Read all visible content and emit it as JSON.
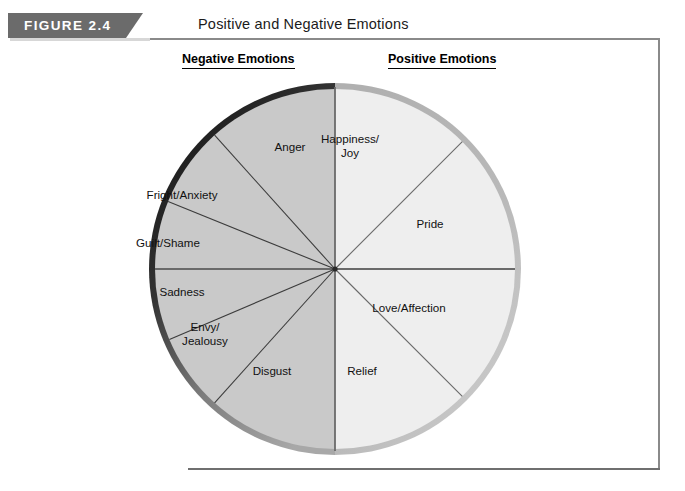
{
  "figure": {
    "number_label": "FIGURE 2.4",
    "title": "Positive and Negative Emotions"
  },
  "columns": {
    "negative_heading": "Negative Emotions",
    "positive_heading": "Positive Emotions"
  },
  "chart_data": {
    "type": "pie",
    "title": "Positive and Negative Emotions",
    "legend_position": "none",
    "grid": false,
    "groups": [
      {
        "name": "Negative Emotions",
        "fill": "#c9c9c9",
        "rim": "#2b2b2b",
        "half": "left",
        "slices": [
          {
            "label": "Anger",
            "start_deg": 90,
            "end_deg": 132
          },
          {
            "label": "Fright/Anxiety",
            "start_deg": 132,
            "end_deg": 158
          },
          {
            "label": "Guilt/Shame",
            "start_deg": 158,
            "end_deg": 180
          },
          {
            "label": "Sadness",
            "start_deg": 180,
            "end_deg": 203
          },
          {
            "label": "Envy/\nJealousy",
            "start_deg": 203,
            "end_deg": 228
          },
          {
            "label": "Disgust",
            "start_deg": 228,
            "end_deg": 270
          }
        ]
      },
      {
        "name": "Positive Emotions",
        "fill": "#ededed",
        "rim": "#b4b4b4",
        "half": "right",
        "slices": [
          {
            "label": "Happiness/\nJoy",
            "start_deg": 45,
            "end_deg": 90
          },
          {
            "label": "Pride",
            "start_deg": 0,
            "end_deg": 45
          },
          {
            "label": "Love/Affection",
            "start_deg": 315,
            "end_deg": 360
          },
          {
            "label": "Relief",
            "start_deg": 270,
            "end_deg": 315
          }
        ]
      }
    ],
    "labels": [
      {
        "name": "anger",
        "text": "Anger",
        "x": 290,
        "y": 147
      },
      {
        "name": "fright-anxiety",
        "text": "Fright/Anxiety",
        "x": 182,
        "y": 195
      },
      {
        "name": "guilt-shame",
        "text": "Guilt/Shame",
        "x": 168,
        "y": 243
      },
      {
        "name": "sadness",
        "text": "Sadness",
        "x": 182,
        "y": 292
      },
      {
        "name": "envy-jealousy",
        "text": "Envy/\nJealousy",
        "x": 205,
        "y": 333
      },
      {
        "name": "disgust",
        "text": "Disgust",
        "x": 272,
        "y": 371
      },
      {
        "name": "happiness-joy",
        "text": "Happiness/\nJoy",
        "x": 350,
        "y": 145
      },
      {
        "name": "pride",
        "text": "Pride",
        "x": 430,
        "y": 224
      },
      {
        "name": "love-affection",
        "text": "Love/Affection",
        "x": 409,
        "y": 308
      },
      {
        "name": "relief",
        "text": "Relief",
        "x": 362,
        "y": 371
      }
    ]
  },
  "colors": {
    "banner": "#6b6b6b",
    "frame_rule": "#8a8a8a",
    "negative_fill": "#c9c9c9",
    "positive_fill": "#ededed",
    "negative_rim_dark": "#1f1f1f",
    "negative_rim_light": "#9a9a9a",
    "positive_rim": "#b4b4b4",
    "spoke": "#4a4a4a"
  }
}
